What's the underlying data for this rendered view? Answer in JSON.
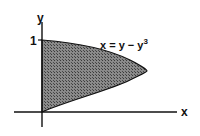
{
  "diagram": {
    "y_axis_label": "y",
    "x_axis_label": "x",
    "y_tick_label": "1",
    "curve_label_main": "x = y − y",
    "curve_label_exp": "3",
    "equation": "x = y - y^3",
    "fill_color": "#6e6e6e",
    "stroke_color": "#111111"
  }
}
